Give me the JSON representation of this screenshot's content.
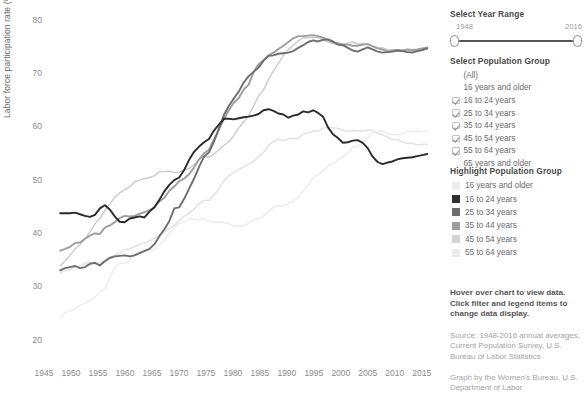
{
  "chart_data": {
    "type": "line",
    "title": "",
    "xlabel": "",
    "ylabel": "Labor force participation rate (%)",
    "xlim": [
      1945,
      2018
    ],
    "ylim": [
      16,
      82
    ],
    "yticks": [
      20,
      30,
      40,
      50,
      60,
      70,
      80
    ],
    "xticks": [
      1945,
      1950,
      1955,
      1960,
      1965,
      1970,
      1975,
      1980,
      1985,
      1990,
      1995,
      2000,
      2005,
      2010,
      2015
    ],
    "grid": false,
    "legend_position": "right-panel",
    "x_start": 1948,
    "x_end": 2016,
    "series": [
      {
        "name": "16 years and older",
        "color": "#e0e0e0",
        "width": 1.4,
        "values": [
          32.7,
          33.1,
          33.3,
          33.9,
          34.0,
          34.5,
          34.7,
          34.4,
          34.6,
          35.1,
          35.7,
          36.0,
          36.4,
          37.1,
          37.2,
          37.6,
          38.1,
          38.3,
          38.7,
          39.2,
          39.7,
          40.4,
          41.1,
          41.6,
          42.6,
          43.3,
          43.9,
          44.7,
          45.7,
          46.3,
          46.3,
          47.3,
          48.4,
          50.0,
          50.9,
          51.5,
          52.1,
          52.6,
          53.1,
          53.6,
          54.5,
          55.3,
          56.6,
          57.4,
          57.8,
          57.5,
          57.9,
          57.9,
          57.9,
          58.8,
          58.9,
          59.3,
          59.3,
          59.8,
          60.0,
          59.9,
          59.8,
          59.5,
          59.2,
          59.4,
          59.3,
          59.3,
          59.5,
          59.4,
          58.8,
          58.6,
          58.1,
          57.7,
          57.7,
          57.2,
          57.0,
          57.0,
          56.7,
          56.8,
          56.8
        ]
      },
      {
        "name": "16 to 24 years",
        "color": "#2b2b2b",
        "width": 1.9,
        "values": [
          43.9,
          43.9,
          43.9,
          44.0,
          43.7,
          43.4,
          43.2,
          43.6,
          44.8,
          45.4,
          44.6,
          43.3,
          42.3,
          42.2,
          42.9,
          43.1,
          43.3,
          43.1,
          44.2,
          45.0,
          46.4,
          48.0,
          49.2,
          50.1,
          50.6,
          52.0,
          53.9,
          55.4,
          56.4,
          57.2,
          57.8,
          59.4,
          60.5,
          61.6,
          61.6,
          61.5,
          61.7,
          61.9,
          62.0,
          62.2,
          62.5,
          63.2,
          63.4,
          63.1,
          62.6,
          62.4,
          61.8,
          62.2,
          62.4,
          63.0,
          62.8,
          63.2,
          62.7,
          62.0,
          60.0,
          58.7,
          58.0,
          57.1,
          57.2,
          57.5,
          57.6,
          57.1,
          56.1,
          54.5,
          53.5,
          53.1,
          53.4,
          53.6,
          54.0,
          54.2,
          54.3,
          54.4,
          54.6,
          54.8,
          55.0
        ]
      },
      {
        "name": "25 to 34 years",
        "color": "#6e6e6e",
        "width": 1.9,
        "values": [
          33.2,
          33.6,
          33.8,
          34.0,
          33.6,
          33.8,
          34.4,
          34.6,
          34.1,
          34.9,
          35.5,
          35.8,
          35.9,
          36.0,
          35.8,
          36.0,
          36.4,
          36.8,
          37.2,
          38.1,
          39.6,
          40.9,
          42.4,
          44.8,
          45.0,
          46.6,
          48.5,
          50.4,
          52.6,
          54.5,
          55.3,
          57.3,
          59.7,
          62.3,
          64.0,
          65.4,
          66.7,
          68.4,
          69.6,
          70.4,
          71.2,
          72.5,
          73.4,
          73.5,
          73.8,
          73.9,
          74.0,
          74.3,
          74.9,
          75.4,
          76.0,
          76.3,
          76.1,
          76.4,
          76.5,
          76.1,
          75.5,
          75.4,
          74.9,
          74.4,
          74.2,
          74.6,
          75.0,
          74.6,
          74.2,
          74.0,
          74.1,
          74.2,
          74.4,
          74.3,
          74.1,
          74.0,
          74.3,
          74.5,
          74.8
        ]
      },
      {
        "name": "35 to 44 years",
        "color": "#9e9e9e",
        "width": 1.9,
        "values": [
          36.9,
          37.2,
          37.6,
          38.3,
          38.4,
          39.1,
          39.7,
          40.1,
          40.0,
          41.2,
          41.6,
          42.2,
          43.0,
          43.4,
          43.3,
          43.4,
          43.8,
          44.1,
          44.5,
          45.0,
          46.1,
          46.8,
          48.1,
          48.9,
          49.9,
          50.4,
          51.2,
          52.5,
          54.0,
          55.1,
          55.8,
          57.8,
          59.6,
          61.5,
          63.2,
          64.6,
          65.5,
          67.1,
          68.0,
          70.4,
          71.8,
          72.6,
          73.5,
          74.0,
          74.7,
          75.3,
          76.0,
          76.7,
          77.1,
          77.1,
          77.2,
          77.3,
          77.1,
          76.8,
          76.4,
          75.9,
          75.8,
          75.5,
          75.5,
          75.3,
          75.3,
          75.5,
          75.6,
          75.2,
          74.8,
          74.6,
          74.2,
          74.4,
          74.5,
          74.4,
          74.6,
          74.5,
          74.6,
          74.8,
          75.0
        ]
      },
      {
        "name": "45 to 54 years",
        "color": "#cacaca",
        "width": 1.4,
        "values": [
          34.0,
          35.0,
          36.0,
          37.2,
          38.0,
          39.1,
          40.4,
          41.9,
          42.9,
          44.4,
          45.6,
          46.9,
          47.7,
          48.3,
          48.8,
          49.8,
          50.1,
          50.4,
          50.6,
          50.9,
          51.7,
          51.7,
          51.8,
          51.5,
          51.6,
          52.0,
          52.3,
          53.0,
          54.0,
          54.6,
          54.4,
          55.0,
          55.8,
          56.6,
          57.3,
          58.4,
          59.9,
          61.0,
          62.2,
          64.0,
          65.9,
          67.0,
          69.0,
          70.6,
          72.0,
          73.5,
          74.6,
          75.4,
          76.2,
          76.8,
          76.8,
          76.9,
          76.8,
          76.4,
          76.0,
          75.7,
          75.6,
          75.6,
          75.8,
          76.0,
          75.6,
          75.7,
          75.6,
          75.2,
          75.0,
          74.9,
          74.6,
          74.5,
          74.3,
          74.4,
          74.3,
          74.2,
          74.4,
          74.5,
          74.7
        ]
      },
      {
        "name": "55 to 64 years",
        "color": "#ececec",
        "width": 1.4,
        "values": [
          24.3,
          25.3,
          25.5,
          26.0,
          26.6,
          27.0,
          27.6,
          28.2,
          29.1,
          29.8,
          31.8,
          33.7,
          34.5,
          34.5,
          35.1,
          36.2,
          36.7,
          37.1,
          37.0,
          37.1,
          38.0,
          38.7,
          40.2,
          41.1,
          42.0,
          42.2,
          42.9,
          42.8,
          42.6,
          42.9,
          42.4,
          42.2,
          42.3,
          42.1,
          42.0,
          41.5,
          41.5,
          41.5,
          42.1,
          42.6,
          42.9,
          43.4,
          44.2,
          45.0,
          45.3,
          45.3,
          45.7,
          46.1,
          47.0,
          48.2,
          49.1,
          50.6,
          51.1,
          51.9,
          52.8,
          53.2,
          53.8,
          54.5,
          55.2,
          56.3,
          56.4,
          57.0,
          58.1,
          59.0,
          59.2,
          59.4,
          58.8,
          58.7,
          58.6,
          58.9,
          59.2,
          59.2,
          59.3,
          59.2,
          59.2
        ]
      }
    ]
  },
  "year_range": {
    "title": "Select Year Range",
    "min": "1948",
    "max": "2016"
  },
  "population_group": {
    "title": "Select Population Group",
    "options": [
      {
        "label": "(All)",
        "checked": false,
        "box": false
      },
      {
        "label": "16 years and older",
        "checked": false,
        "box": false
      },
      {
        "label": "16 to 24 years",
        "checked": true,
        "box": true
      },
      {
        "label": "25 to 34 years",
        "checked": true,
        "box": true
      },
      {
        "label": "35 to 44 years",
        "checked": true,
        "box": true
      },
      {
        "label": "45 to 54 years",
        "checked": true,
        "box": true
      },
      {
        "label": "55 to 64 years",
        "checked": true,
        "box": true
      },
      {
        "label": "65 years and older",
        "checked": false,
        "box": false
      }
    ]
  },
  "highlight_group": {
    "title": "Highlight Population Group",
    "items": [
      {
        "label": "16 years and older",
        "color": "#ededed"
      },
      {
        "label": "16 to 24 years",
        "color": "#2f2f2f"
      },
      {
        "label": "25 to 34 years",
        "color": "#6b6b6b"
      },
      {
        "label": "35 to 44 years",
        "color": "#9d9d9d"
      },
      {
        "label": "45 to 54 years",
        "color": "#d3d3d3"
      },
      {
        "label": "55 to 64 years",
        "color": "#ebebeb"
      }
    ]
  },
  "notes": {
    "instruction_line1": "Hover over chart to view data.",
    "instruction_line2": "Click filter and legend items to",
    "instruction_line3": "change data display.",
    "source_line1": "Source: 1948-2016 annual averages,",
    "source_line2": "Current Population Survey, U.S.",
    "source_line3": "Bureau of Labor Statistics",
    "credit_line1": "Graph by the Women's Bureau, U.S.",
    "credit_line2": "Department of Labor"
  }
}
